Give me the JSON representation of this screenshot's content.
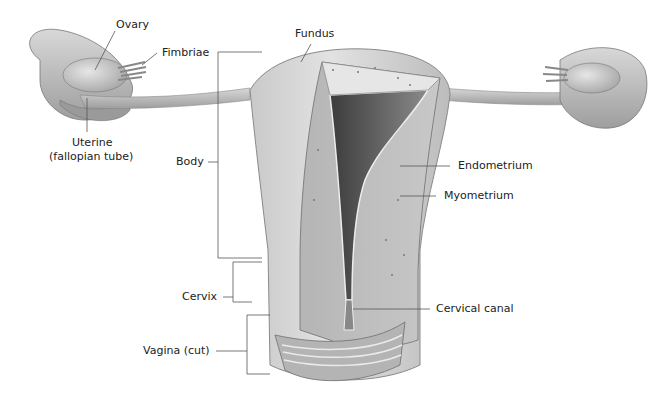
{
  "diagram": {
    "labels": {
      "ovary": "Ovary",
      "fimbriae": "Fimbriae",
      "uterine_line1": "Uterine",
      "uterine_line2": "(fallopian tube)",
      "fundus": "Fundus",
      "body": "Body",
      "endometrium": "Endometrium",
      "myometrium": "Myometrium",
      "cervix": "Cervix",
      "cervical_canal": "Cervical canal",
      "vagina": "Vagina (cut)"
    },
    "colors": {
      "tissue_light": "#d6d6d6",
      "tissue_mid": "#a9a9a9",
      "tissue_dark": "#6f6f6f",
      "cavity": "#4a4a4a",
      "leader_line": "#555555"
    }
  }
}
